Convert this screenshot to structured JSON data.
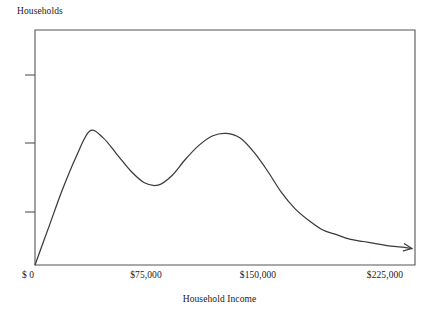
{
  "chart_data": {
    "type": "line",
    "title": "",
    "ylabel": "Households",
    "xlabel": "Household Income",
    "x_tick_labels": [
      "$ 0",
      "$75,000",
      "$150,000",
      "$225,000"
    ],
    "x_tick_values": [
      0,
      75000,
      150000,
      225000
    ],
    "y_tick_labels": [
      "",
      "",
      ""
    ],
    "xlim": [
      0,
      250000
    ],
    "ylim": [
      0,
      100
    ],
    "grid": false,
    "legend": null,
    "axis_style": "box-frame-with-left-ticks",
    "curve_color": "#3a3a3a",
    "frame_color": "#555555",
    "series": [
      {
        "name": "Households",
        "x": [
          0,
          9000,
          18000,
          27000,
          36000,
          45000,
          54000,
          63000,
          72000,
          81000,
          90000,
          99000,
          108000,
          117000,
          126000,
          135000,
          144000,
          153000,
          162000,
          171000,
          180000,
          189000,
          198000,
          207000,
          216000,
          225000,
          234000,
          243000,
          248000
        ],
        "y": [
          0,
          16,
          32,
          46,
          57,
          54,
          47,
          40,
          35,
          34,
          38,
          45,
          51,
          55,
          56,
          54,
          48,
          40,
          31,
          24,
          19,
          15,
          13,
          11,
          10,
          9,
          8,
          7.5,
          7
        ]
      }
    ],
    "annotations": [
      {
        "name": "right-tail-arrowhead",
        "x": 248000,
        "y": 7
      }
    ]
  }
}
